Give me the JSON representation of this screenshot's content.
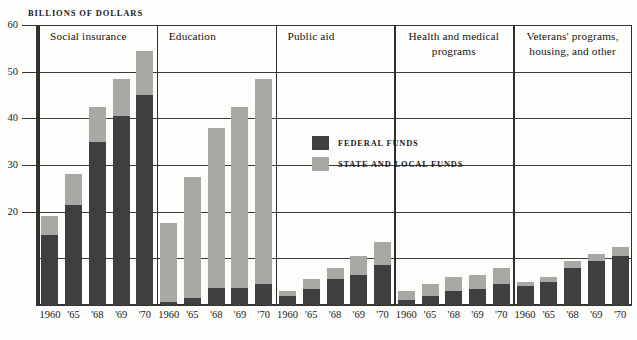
{
  "chart_data": {
    "type": "bar",
    "title": "BILLIONS OF DOLLARS",
    "subtitle": "",
    "xlabel": "",
    "ylabel": "BILLIONS OF DOLLARS",
    "ylim": [
      0,
      60
    ],
    "grid": true,
    "stacked": true,
    "legend_position": "inside-upper-center",
    "categories": [
      "1960",
      "'65",
      "'68",
      "'69",
      "'70"
    ],
    "y_ticks": [
      {
        "value": 60,
        "label": "60"
      },
      {
        "value": 50,
        "label": "50"
      },
      {
        "value": 40,
        "label": "40"
      },
      {
        "value": 30,
        "label": "30"
      },
      {
        "value": 20,
        "label": "20"
      },
      {
        "value": 10,
        "label": ""
      }
    ],
    "series": [
      {
        "name": "FEDERAL FUNDS",
        "color": "#3f3f3f"
      },
      {
        "name": "STATE AND LOCAL FUNDS",
        "color": "#a8a8a4"
      }
    ],
    "panels": [
      {
        "title": "Social insurance",
        "federal": [
          15.0,
          21.5,
          35.0,
          40.5,
          45.0
        ],
        "state_local": [
          4.0,
          6.5,
          7.5,
          8.0,
          9.5
        ],
        "totals": [
          19.0,
          28.0,
          42.5,
          48.5,
          54.5
        ]
      },
      {
        "title": "Education",
        "federal": [
          0.6,
          1.6,
          3.6,
          3.6,
          4.6
        ],
        "state_local": [
          16.9,
          25.9,
          34.4,
          38.9,
          43.9
        ],
        "totals": [
          17.5,
          27.5,
          38.0,
          42.5,
          48.5
        ]
      },
      {
        "title": "Public aid",
        "federal": [
          2.0,
          3.5,
          5.5,
          6.5,
          8.5
        ],
        "state_local": [
          1.0,
          2.0,
          2.5,
          4.0,
          5.0
        ],
        "totals": [
          3.0,
          5.5,
          8.0,
          10.5,
          13.5
        ]
      },
      {
        "title": "Health and medical programs",
        "federal": [
          1.0,
          2.0,
          3.0,
          3.5,
          4.5
        ],
        "state_local": [
          2.0,
          2.5,
          3.0,
          3.0,
          3.5
        ],
        "totals": [
          3.0,
          4.5,
          6.0,
          6.5,
          8.0
        ]
      },
      {
        "title": "Veterans' programs, housing, and other",
        "federal": [
          4.0,
          5.0,
          8.0,
          9.5,
          10.5
        ],
        "state_local": [
          1.0,
          1.0,
          1.5,
          1.5,
          2.0
        ],
        "totals": [
          5.0,
          6.0,
          9.5,
          11.0,
          12.5
        ]
      }
    ],
    "legend": [
      {
        "label": "FEDERAL FUNDS",
        "color": "#3f3f3f"
      },
      {
        "label": "STATE AND LOCAL FUNDS",
        "color": "#a8a8a4"
      }
    ],
    "colors": {
      "federal": "#3f3f3f",
      "state_local": "#a8a8a4",
      "axis": "#33332f",
      "grid": "#3b3b37",
      "background": "#fdfdfb",
      "text": "#1a1a18"
    }
  }
}
